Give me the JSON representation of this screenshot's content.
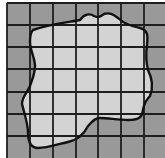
{
  "diagram": {
    "title": "",
    "grid": {
      "rows": 7,
      "columns": 7,
      "x_lines": [
        7,
        30,
        53,
        76,
        98,
        121,
        144,
        167
      ],
      "y_lines": [
        3,
        25,
        47,
        69,
        92,
        114,
        136,
        159
      ]
    },
    "colors": {
      "background": "#ffffff",
      "outside_fill": "#999999",
      "inside_fill": "#d3d3d3",
      "grid_line": "#1e1e1e",
      "outline": "#111111"
    },
    "shape_outline_path": "M33,30 C 50,24 70,22 80,20 C 84,14 90,13 94,16 C 98,18 100,17 104,14 C 110,12 114,15 118,18 C 124,24 132,26 140,28 C 148,30 148,36 147,45 C 146,52 146,62 148,70 C 152,78 154,86 150,96 C 146,100 144,104 143,110 C 142,118 138,120 128,120 C 118,120 108,118 100,118 C 94,118 92,122 88,126 C 84,134 78,140 68,142 C 58,144 48,148 38,148 C 30,148 28,140 28,132 C 28,124 24,112 22,104 C 22,96 28,92 30,86 C 32,80 35,74 35,66 C 35,58 30,50 30,42 C 30,36 31,32 33,30 Z"
  }
}
